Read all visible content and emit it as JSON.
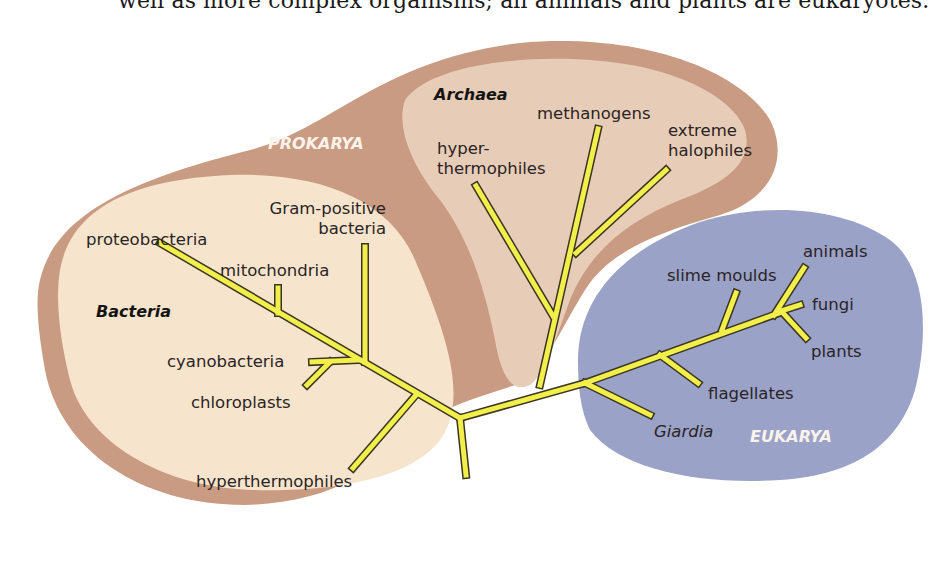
{
  "caption": "well as more complex organisms; all animals and plants are eukaryotes.",
  "colors": {
    "prokarya_outer": "#c99b82",
    "bacteria_fill": "#f7e4cd",
    "archaea_fill": "#e7cdb7",
    "eukarya_fill": "#9ba2c8",
    "branch_fill": "#f2ee4a",
    "branch_outline": "#3a3524",
    "domain_text": "#fbf3ea"
  },
  "domains": {
    "prokarya": "PROKARYA",
    "eukarya": "EUKARYA"
  },
  "groups": {
    "bacteria": "Bacteria",
    "archaea": "Archaea"
  },
  "labels": {
    "proteobacteria": "proteobacteria",
    "mitochondria": "mitochondria",
    "gram_positive_1": "Gram-positive",
    "gram_positive_2": "bacteria",
    "cyanobacteria": "cyanobacteria",
    "chloroplasts": "chloroplasts",
    "hyperthermophiles_bacteria": "hyperthermophiles",
    "hyperthermophiles_archaea_1": "hyper-",
    "hyperthermophiles_archaea_2": "thermophiles",
    "methanogens": "methanogens",
    "extreme_halophiles_1": "extreme",
    "extreme_halophiles_2": "halophiles",
    "slime_moulds": "slime moulds",
    "animals": "animals",
    "fungi": "fungi",
    "plants": "plants",
    "flagellates": "flagellates",
    "giardia": "Giardia"
  }
}
